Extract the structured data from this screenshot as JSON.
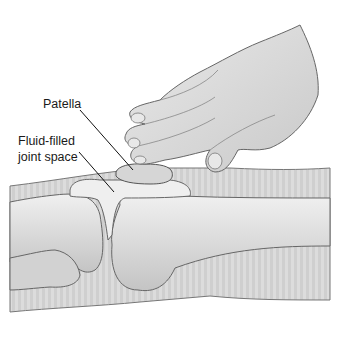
{
  "figure": {
    "labels": {
      "patella": "Patella",
      "fluid_line1": "Fluid-filled",
      "fluid_line2": "joint space"
    },
    "colors": {
      "skin_light": "#e6e6e6",
      "skin_mid": "#c8c8c8",
      "bone": "#d9d9d9",
      "outline": "#555555",
      "leader": "#111111"
    }
  }
}
